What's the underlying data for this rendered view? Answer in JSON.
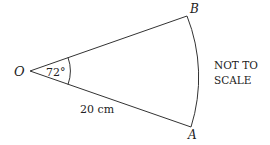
{
  "diagram": {
    "type": "sector",
    "points": {
      "center": {
        "label": "O",
        "x": 30,
        "y": 71
      },
      "upper": {
        "label": "B",
        "x": 187,
        "y": 16
      },
      "lower": {
        "label": "A",
        "x": 191,
        "y": 127
      }
    },
    "angle_label": "72°",
    "radius_label": "20 cm",
    "note_line1": "NOT TO",
    "note_line2": "SCALE",
    "stroke_color": "#333333"
  }
}
